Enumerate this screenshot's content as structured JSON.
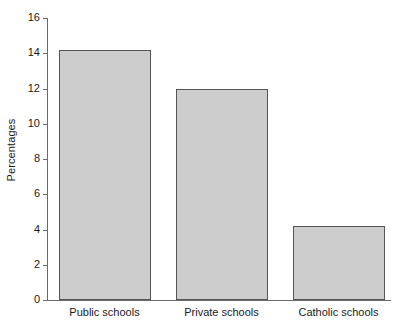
{
  "chart_data": {
    "type": "bar",
    "title": "",
    "subtitle": "",
    "xlabel": "",
    "ylabel": "Percentages",
    "categories": [
      "Public schools",
      "Private schools",
      "Catholic schools"
    ],
    "values": [
      14.2,
      12.0,
      4.2
    ],
    "ylim": [
      0,
      16
    ],
    "yticks": [
      0,
      2,
      4,
      6,
      8,
      10,
      12,
      14,
      16
    ],
    "ytick_labels": [
      "0",
      "2",
      "4",
      "6",
      "8",
      "10",
      "12",
      "14",
      "16"
    ],
    "grid": false,
    "legend": null,
    "legend_position": "none",
    "annotations": [],
    "bar_fill_color": "#cdcdcd",
    "bar_border_color": "#555555",
    "axis_color": "#6a6a6a",
    "background_color": "#ffffff"
  }
}
